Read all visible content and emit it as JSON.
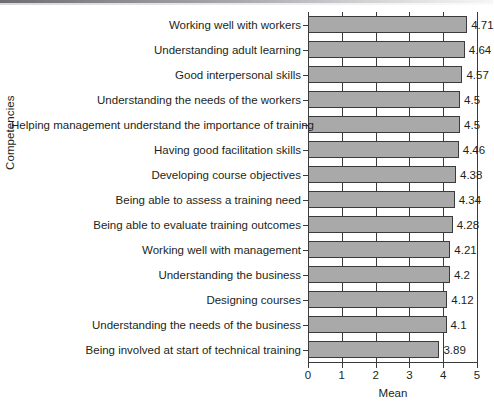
{
  "chart_data": {
    "type": "bar",
    "orientation": "horizontal",
    "title": "",
    "xlabel": "Mean",
    "ylabel": "Competencies",
    "xlim": [
      0,
      5
    ],
    "xticks": [
      "0",
      "1",
      "2",
      "3",
      "4",
      "5"
    ],
    "grid": true,
    "legend": null,
    "bar_color": "#a9a9a9",
    "bar_edge_color": "#3b3b3d",
    "categories": [
      "Working well with workers",
      "Understanding adult learning",
      "Good interpersonal skills",
      "Understanding the needs of the workers",
      "Helping management understand the importance of training",
      "Having good facilitation skills",
      "Developing course objectives",
      "Being able to assess a training need",
      "Being able to evaluate training outcomes",
      "Working well with management",
      "Understanding the business",
      "Designing courses",
      "Understanding the needs of the business",
      "Being involved at start of technical training"
    ],
    "values": [
      4.71,
      4.64,
      4.57,
      4.5,
      4.5,
      4.46,
      4.38,
      4.34,
      4.28,
      4.21,
      4.2,
      4.12,
      4.1,
      3.89
    ],
    "value_labels": [
      "4.71",
      "4.64",
      "4.57",
      "4.5",
      "4.5",
      "4.46",
      "4.38",
      "4.34",
      "4.28",
      "4.21",
      "4.2",
      "4.12",
      "4.1",
      "3.89"
    ]
  }
}
